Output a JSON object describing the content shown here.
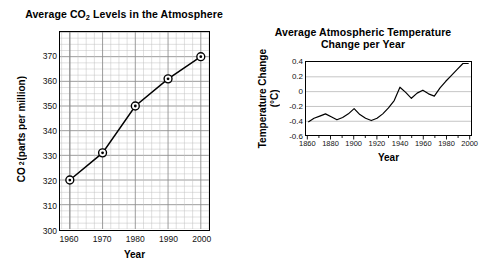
{
  "chart_data": [
    {
      "id": "co2",
      "type": "line",
      "title": "Average CO2 Levels in the Atmosphere",
      "title_html": "Average CO<sub>2</sub> Levels in the Atmosphere",
      "xlabel": "Year",
      "ylabel": "CO2 (parts per million)",
      "ylabel_html": "CO<sub>2</sub> (parts per million)",
      "x": [
        1960,
        1970,
        1980,
        1990,
        2000
      ],
      "values": [
        320,
        331,
        350,
        361,
        370
      ],
      "xticks": [
        1960,
        1970,
        1980,
        1990,
        2000
      ],
      "yticks": [
        300,
        310,
        320,
        330,
        340,
        350,
        360,
        370
      ],
      "xlim": [
        1957,
        2002.5
      ],
      "ylim": [
        300,
        380
      ],
      "grid": "both",
      "minor_grid": true,
      "marker": "circle-dot",
      "line_color": "#000000",
      "grid_color": "#bfbfbf",
      "major_grid_color": "#8a8a8a",
      "legend": "none"
    },
    {
      "id": "temperature",
      "type": "line",
      "title_line1": "Average Atmospheric Temperature",
      "title_line2": "Change per Year",
      "xlabel": "Year",
      "ylabel_line1": "Temperature Change",
      "ylabel_line2": "(°C)",
      "xticks": [
        1860,
        1880,
        1900,
        1920,
        1940,
        1960,
        1980,
        2000
      ],
      "yticks": [
        "0.4",
        "0.2",
        "0",
        "-0.2",
        "-0.4",
        "-0.6"
      ],
      "ytick_values": [
        0.4,
        0.2,
        0,
        -0.2,
        -0.4,
        -0.6
      ],
      "xlim": [
        1858,
        2002
      ],
      "ylim": [
        -0.6,
        0.4
      ],
      "grid": "horizontal",
      "minor_grid": false,
      "line_color": "#000000",
      "grid_color": "#b5b5b5",
      "legend": "none",
      "x": [
        1860,
        1865,
        1870,
        1875,
        1880,
        1885,
        1890,
        1895,
        1900,
        1905,
        1910,
        1915,
        1920,
        1925,
        1930,
        1935,
        1940,
        1945,
        1950,
        1955,
        1960,
        1965,
        1970,
        1975,
        1980,
        1985,
        1990,
        1995,
        2000
      ],
      "values": [
        -0.41,
        -0.36,
        -0.33,
        -0.3,
        -0.34,
        -0.38,
        -0.35,
        -0.3,
        -0.23,
        -0.31,
        -0.36,
        -0.39,
        -0.36,
        -0.3,
        -0.22,
        -0.12,
        0.06,
        -0.01,
        -0.09,
        -0.02,
        0.02,
        -0.03,
        -0.06,
        0.05,
        0.14,
        0.22,
        0.3,
        0.38,
        0.38
      ]
    }
  ],
  "co2": {
    "title_prefix": "Average CO",
    "title_sub": "2",
    "title_suffix": " Levels in the Atmosphere",
    "ylabel_prefix": "CO",
    "ylabel_sub": "2",
    "ylabel_suffix": " (parts per million)",
    "xlabel": "Year"
  },
  "temperature": {
    "title_line1": "Average Atmospheric Temperature",
    "title_line2": "Change per Year",
    "ylabel_line1": "Temperature Change",
    "ylabel_line2": "(°C)",
    "xlabel": "Year"
  }
}
